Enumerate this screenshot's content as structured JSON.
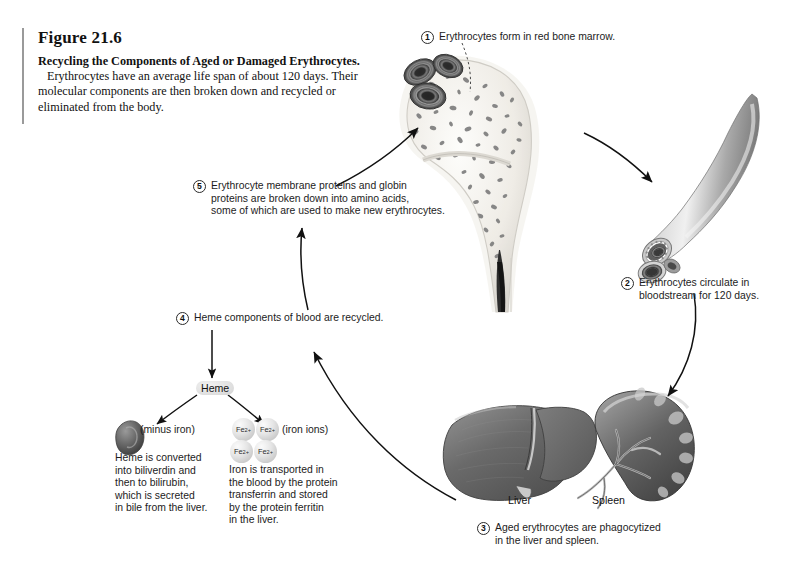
{
  "figure": {
    "number": "Figure 21.6",
    "title_bold": "Recycling the Components of Aged or Damaged Erythrocytes.",
    "body": "Erythrocytes have an average life span of about 120 days. Their molecular components are then broken down and recycled or eliminated from the body."
  },
  "steps": [
    {
      "n": "1",
      "text": "Erythrocytes form in red bone marrow."
    },
    {
      "n": "2",
      "text": "Erythrocytes circulate in\nbloodstream for 120 days."
    },
    {
      "n": "3",
      "text": "Aged erythrocytes are phagocytized\nin the liver and spleen."
    },
    {
      "n": "4",
      "text": "Heme components of blood are recycled."
    },
    {
      "n": "5",
      "text": "Erythrocyte membrane proteins and globin\nproteins are broken down into amino acids,\nsome of which are used to make new erythrocytes."
    }
  ],
  "labels": {
    "heme": "Heme",
    "minus_iron": "(minus iron)",
    "iron_ions": "(iron ions)",
    "biliverdin_text": "Heme is converted\ninto biliverdin and\nthen to bilirubin,\nwhich is secreted\nin bile from the liver.",
    "iron_text": "Iron is transported in\nthe blood by the protein\ntransferrin and stored\nby the protein ferritin\nin the liver.",
    "liver": "Liver",
    "spleen": "Spleen",
    "ion_symbol": "Fe",
    "ion_charge": "2+"
  },
  "illustrations": {
    "bone_marrow": "proximal-femur-bone-marrow-illustration",
    "erythrocyte_cluster": "erythrocyte-cluster-illustration",
    "blood_vessel": "blood-vessel-cutaway-illustration",
    "liver": "liver-illustration",
    "spleen": "spleen-illustration",
    "biliverdin_blob": "biliverdin-particle-illustration"
  },
  "colors": {
    "ink": "#1a1a1a",
    "rule": "#9a9a9a",
    "arrow": "#111111",
    "organ_dark": "#6b6b6b",
    "organ_light": "#cfcfcf",
    "bone_fill": "#e9e7e2",
    "marrow_speckle": "#8a8a8a"
  }
}
